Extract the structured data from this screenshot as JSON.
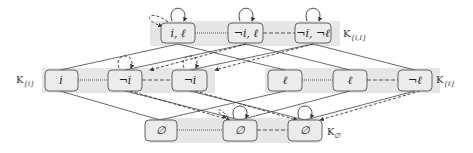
{
  "diagram": {
    "colors": {
      "band": "#e6e6e6",
      "node_fill": "#ececec",
      "node_stroke": "#555555",
      "edge": "#444444"
    },
    "groups": [
      {
        "id": "K_il",
        "label": "K",
        "subscript": "{i,ℓ}"
      },
      {
        "id": "K_i",
        "label": "K",
        "subscript": "{i}"
      },
      {
        "id": "K_l",
        "label": "K",
        "subscript": "{ℓ}"
      },
      {
        "id": "K_empty",
        "label": "K",
        "subscript": "∅"
      }
    ],
    "nodes": {
      "top": [
        "i, ℓ",
        "¬i, ℓ",
        "¬i, ¬ℓ"
      ],
      "middle_left": [
        "i",
        "¬i",
        "¬i"
      ],
      "middle_right": [
        "ℓ",
        "ℓ",
        "¬ℓ"
      ],
      "bottom": [
        "∅",
        "∅",
        "∅"
      ]
    }
  }
}
